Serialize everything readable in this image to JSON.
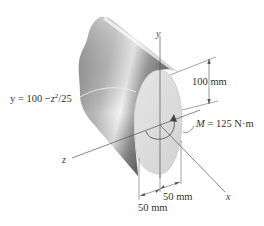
{
  "figure": {
    "colors": {
      "background": "#ffffff",
      "body_dark": "#4a4a4a",
      "body_light": "#f2f2f2",
      "face": "#dcdcdc",
      "line": "#555555",
      "text": "#333333"
    }
  },
  "axes": {
    "y_label": "y",
    "z_label": "z",
    "x_label": "x"
  },
  "equation": {
    "lhs": "y = 100 −",
    "var": "z",
    "exp": "2",
    "rhs": "/25"
  },
  "moment": {
    "symbol": "M",
    "value_text": "= 125 N·m"
  },
  "dimensions": {
    "height": "100 mm",
    "half_width_right": "50 mm",
    "half_width_left": "50 mm"
  }
}
